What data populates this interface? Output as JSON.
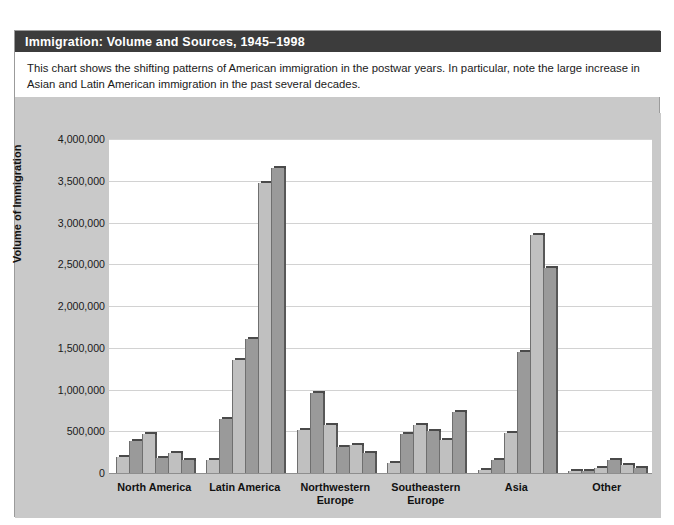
{
  "header": {
    "title": "Immigration: Volume and Sources, 1945–1998"
  },
  "caption": {
    "text": "This chart shows the shifting patterns of American immigration in the postwar years. In particular, note the large increase in Asian and Latin American immigration in the past several decades."
  },
  "colors": {
    "title_band": "#3c3c3c",
    "panel": "#c9c9c9",
    "plot": "#ffffff",
    "gridline": "#d2d2d2",
    "bar_light": "#c0c0c0",
    "bar_dark": "#9a9a9a",
    "bar_top": "#4a4a4a"
  },
  "chart_data": {
    "type": "bar",
    "title": "Immigration: Volume and Sources, 1945–1998",
    "xlabel": "",
    "ylabel": "Volume of Immigration",
    "ylim": [
      0,
      4000000
    ],
    "grid": true,
    "legend_position": "none",
    "ytick_labels": [
      "4,000,000",
      "3,500,000",
      "3,000,000",
      "2,500,000",
      "2,000,000",
      "1,500,000",
      "1,000,000",
      "500,000",
      "0"
    ],
    "ytick_values": [
      4000000,
      3500000,
      3000000,
      2500000,
      2000000,
      1500000,
      1000000,
      500000,
      0
    ],
    "categories": [
      "North America",
      "Latin America",
      "Northwestern Europe",
      "Southeastern Europe",
      "Asia",
      "Other"
    ],
    "category_lines": [
      [
        "North America"
      ],
      [
        "Latin America"
      ],
      [
        "Northwestern",
        "Europe"
      ],
      [
        "Southeastern",
        "Europe"
      ],
      [
        "Asia"
      ],
      [
        "Other"
      ]
    ],
    "series": [
      {
        "name": "period-1",
        "values": [
          190000,
          150000,
          510000,
          120000,
          35000,
          20000
        ]
      },
      {
        "name": "period-2",
        "values": [
          380000,
          650000,
          960000,
          470000,
          150000,
          30000
        ]
      },
      {
        "name": "period-3",
        "values": [
          470000,
          1350000,
          580000,
          580000,
          480000,
          55000
        ]
      },
      {
        "name": "period-4",
        "values": [
          180000,
          1600000,
          310000,
          500000,
          1450000,
          150000
        ]
      },
      {
        "name": "period-5",
        "values": [
          240000,
          3470000,
          330000,
          390000,
          2850000,
          100000
        ]
      },
      {
        "name": "period-6",
        "values": [
          150000,
          3650000,
          240000,
          730000,
          2450000,
          60000
        ]
      }
    ]
  }
}
